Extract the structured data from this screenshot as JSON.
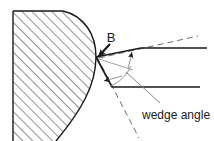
{
  "figure": {
    "type": "technical-diagram",
    "background_color": "#ffffff",
    "line_color": "#1a1a1a",
    "hatch_color": "#555555",
    "thin_line_color": "#8a8a8a",
    "dashed_line_color": "#6e6e6e",
    "width": 214,
    "height": 141
  },
  "labels": {
    "callout_b": "B",
    "wedge_angle": "wedge angle"
  },
  "parts": {
    "workpiece_name": "hatched-workpiece",
    "tool_name": "cutting-tool-wedge",
    "vertex_name": "contact-vertex",
    "upper_face_name": "tool-upper-face",
    "lower_face_name": "tool-lower-face",
    "rake_dashed_name": "rake-reference-dashed-line",
    "clearance_dashed_name": "clearance-reference-dashed-line",
    "angle_arc_name": "wedge-angle-arc",
    "leader_name": "wedge-angle-leader-line",
    "b_arrow_name": "callout-b-arrow"
  }
}
